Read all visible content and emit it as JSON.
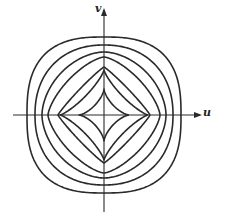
{
  "figure": {
    "axes": {
      "x_label": "u",
      "y_label": "v",
      "origin_px": [
        104,
        115
      ],
      "x_axis_px": [
        13,
        200
      ],
      "y_axis_px": [
        212,
        10
      ]
    },
    "stroke_color": "#2a2a2a",
    "background_color": "#ffffff",
    "curves": [
      {
        "name": "contour-1",
        "half_width": 77,
        "half_height": 78,
        "exponent": 1.35
      },
      {
        "name": "contour-2",
        "half_width": 69,
        "half_height": 70,
        "exponent": 1.1
      },
      {
        "name": "contour-3",
        "half_width": 62,
        "half_height": 63,
        "exponent": 0.9
      },
      {
        "name": "contour-4",
        "half_width": 56,
        "half_height": 58,
        "exponent": 0.72
      },
      {
        "name": "contour-5",
        "half_width": 46,
        "half_height": 48,
        "exponent": 0.55
      },
      {
        "name": "contour-6",
        "half_width": 44,
        "half_height": 45,
        "exponent": 0.4
      },
      {
        "name": "contour-7",
        "half_width": 25,
        "half_height": 26,
        "exponent": 0.35
      }
    ]
  }
}
